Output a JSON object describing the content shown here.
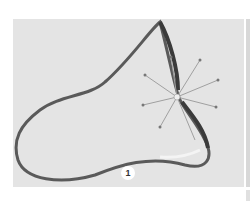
{
  "figure": {
    "label": "1",
    "colors": {
      "background": "#ffffff",
      "photo_background": "#e4e4e4",
      "ribbon": "#5a5a5a",
      "pins": "#9a9a9a",
      "badge": "#ffffff"
    }
  }
}
